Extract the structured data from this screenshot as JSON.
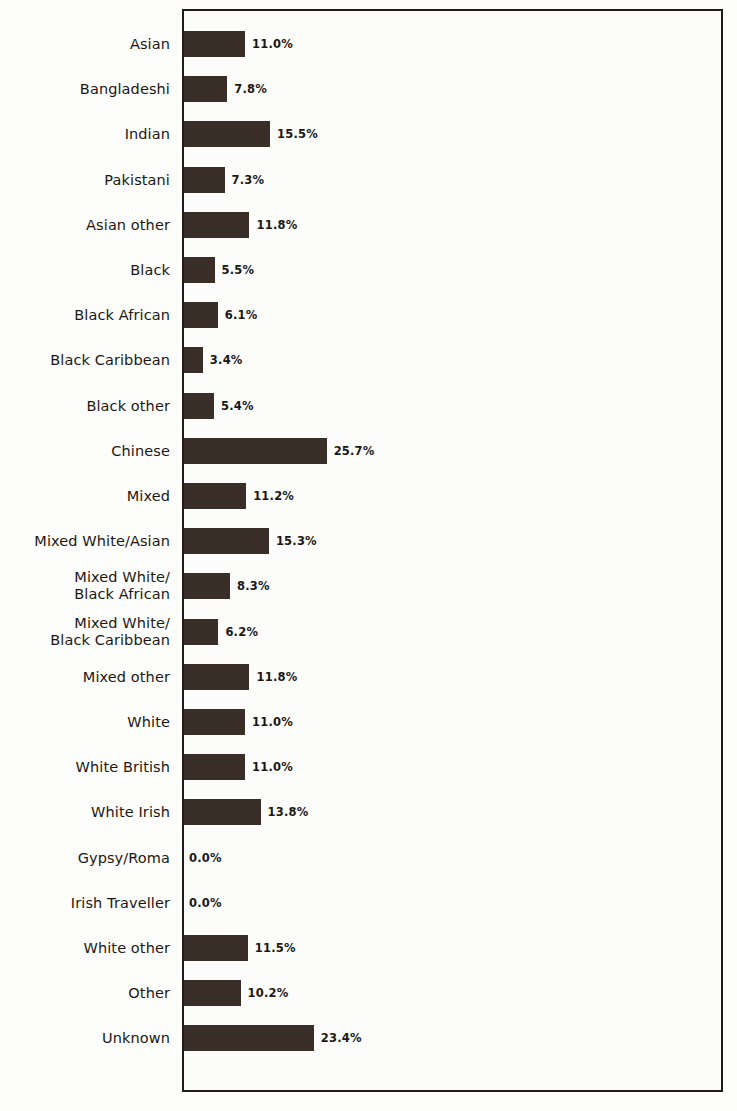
{
  "chart_data": {
    "type": "bar",
    "orientation": "horizontal",
    "title": "",
    "subtitle": "",
    "xlabel": "",
    "ylabel": "",
    "grid": false,
    "legend": null,
    "value_suffix": "%",
    "xlim": [
      0,
      28
    ],
    "axis_visible": {
      "left": true,
      "right": true,
      "top": true,
      "bottom": true
    },
    "categories": [
      "Asian",
      "Bangladeshi",
      "Indian",
      "Pakistani",
      "Asian other",
      "Black",
      "Black African",
      "Black Caribbean",
      "Black other",
      "Chinese",
      "Mixed",
      "Mixed White/Asian",
      "Mixed White/\nBlack African",
      "Mixed White/\nBlack Caribbean",
      "Mixed other",
      "White",
      "White British",
      "White Irish",
      "Gypsy/Roma",
      "Irish Traveller",
      "White other",
      "Other",
      "Unknown"
    ],
    "values": [
      11.0,
      7.8,
      15.5,
      7.3,
      11.8,
      5.5,
      6.1,
      3.4,
      5.4,
      25.7,
      11.2,
      15.3,
      8.3,
      6.2,
      11.8,
      11.0,
      11.0,
      13.8,
      0.0,
      0.0,
      11.5,
      10.2,
      23.4
    ],
    "data_labels": [
      "11.0%",
      "7.8%",
      "15.5%",
      "7.3%",
      "11.8%",
      "5.5%",
      "6.1%",
      "3.4%",
      "5.4%",
      "25.7%",
      "11.2%",
      "15.3%",
      "8.3%",
      "6.2%",
      "11.8%",
      "11.0%",
      "11.0%",
      "13.8%",
      "0.0%",
      "0.0%",
      "11.5%",
      "10.2%",
      "23.4%"
    ],
    "colors": {
      "bar": "#3a2f28",
      "axis": "#221c18",
      "text": "#1c1713",
      "plot_background": "#fcfcfa",
      "page_background": "#fdfdfb"
    }
  }
}
